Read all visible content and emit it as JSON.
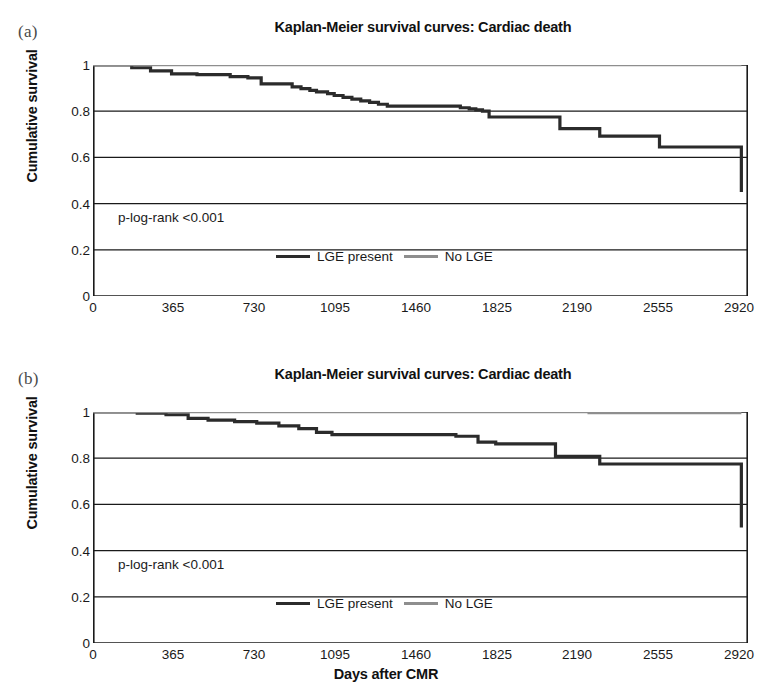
{
  "figure": {
    "xaxis_title": "Days after CMR"
  },
  "panels": [
    {
      "letter": "(a)",
      "title": "Kaplan-Meier survival curves: Cardiac death",
      "ylabel": "Cumulative survival",
      "pvalue": "p-log-rank <0.001",
      "legend": [
        {
          "label": "LGE present",
          "color": "#2b2b2b"
        },
        {
          "label": "No LGE",
          "color": "#8e8e8e"
        }
      ],
      "xticks": [
        "0",
        "365",
        "730",
        "1095",
        "1460",
        "1825",
        "2190",
        "2555",
        "2920"
      ],
      "yticks": [
        "1",
        "0.8",
        "0.6",
        "0.4",
        "0.2",
        "0"
      ]
    },
    {
      "letter": "(b)",
      "title": "Kaplan-Meier survival curves: Cardiac death",
      "ylabel": "Cumulative survival",
      "pvalue": "p-log-rank <0.001",
      "legend": [
        {
          "label": "LGE present",
          "color": "#2b2b2b"
        },
        {
          "label": "No LGE",
          "color": "#8e8e8e"
        }
      ],
      "xticks": [
        "0",
        "365",
        "730",
        "1095",
        "1460",
        "1825",
        "2190",
        "2555",
        "2920"
      ],
      "yticks": [
        "1",
        "0.8",
        "0.6",
        "0.4",
        "0.2",
        "0"
      ]
    }
  ],
  "chart_data": [
    {
      "type": "line",
      "panel": "(a)",
      "title": "Kaplan-Meier survival curves: Cardiac death",
      "xlabel": "Days after CMR",
      "ylabel": "Cumulative survival",
      "xlim": [
        0,
        2960
      ],
      "ylim": [
        0,
        1
      ],
      "xticks": [
        0,
        365,
        730,
        1095,
        1460,
        1825,
        2190,
        2555,
        2920
      ],
      "yticks": [
        0,
        0.2,
        0.4,
        0.6,
        0.8,
        1
      ],
      "grid": "horizontal",
      "legend_position": "bottom-center",
      "annotations": [
        "p-log-rank <0.001"
      ],
      "series": [
        {
          "name": "LGE present",
          "color": "#2b2b2b",
          "step": "post",
          "x": [
            0,
            150,
            175,
            230,
            260,
            330,
            355,
            420,
            470,
            560,
            620,
            660,
            700,
            730,
            760,
            860,
            900,
            940,
            980,
            1010,
            1060,
            1090,
            1130,
            1170,
            1210,
            1250,
            1290,
            1330,
            1600,
            1660,
            1700,
            1730,
            1760,
            1790,
            2080,
            2110,
            2260,
            2290,
            2540,
            2560,
            2930,
            2930
          ],
          "y": [
            1.0,
            1.0,
            0.988,
            0.988,
            0.975,
            0.975,
            0.962,
            0.962,
            0.958,
            0.958,
            0.95,
            0.95,
            0.944,
            0.944,
            0.918,
            0.918,
            0.905,
            0.898,
            0.89,
            0.884,
            0.876,
            0.868,
            0.86,
            0.852,
            0.845,
            0.838,
            0.83,
            0.822,
            0.822,
            0.815,
            0.81,
            0.806,
            0.8,
            0.775,
            0.775,
            0.725,
            0.725,
            0.692,
            0.692,
            0.645,
            0.645,
            0.45
          ]
        },
        {
          "name": "No LGE",
          "color": "#8e8e8e",
          "step": "post",
          "x": [
            0,
            2930
          ],
          "y": [
            1.0,
            1.0
          ]
        }
      ]
    },
    {
      "type": "line",
      "panel": "(b)",
      "title": "Kaplan-Meier survival curves: Cardiac death",
      "xlabel": "Days after CMR",
      "ylabel": "Cumulative survival",
      "xlim": [
        0,
        2960
      ],
      "ylim": [
        0,
        1
      ],
      "xticks": [
        0,
        365,
        730,
        1095,
        1460,
        1825,
        2190,
        2555,
        2920
      ],
      "yticks": [
        0,
        0.2,
        0.4,
        0.6,
        0.8,
        1
      ],
      "grid": "horizontal",
      "legend_position": "bottom-center",
      "annotations": [
        "p-log-rank <0.001"
      ],
      "series": [
        {
          "name": "LGE present",
          "color": "#2b2b2b",
          "step": "post",
          "x": [
            0,
            170,
            200,
            300,
            330,
            400,
            430,
            480,
            520,
            600,
            640,
            700,
            740,
            800,
            840,
            900,
            930,
            980,
            1010,
            1050,
            1080,
            1600,
            1640,
            1700,
            1740,
            1780,
            1820,
            1860,
            2060,
            2090,
            2260,
            2290,
            2930,
            2930
          ],
          "y": [
            1.0,
            1.0,
            0.995,
            0.995,
            0.988,
            0.988,
            0.972,
            0.972,
            0.965,
            0.965,
            0.958,
            0.958,
            0.952,
            0.952,
            0.94,
            0.94,
            0.928,
            0.928,
            0.912,
            0.912,
            0.902,
            0.902,
            0.895,
            0.895,
            0.87,
            0.87,
            0.862,
            0.862,
            0.862,
            0.808,
            0.808,
            0.775,
            0.775,
            0.5
          ]
        },
        {
          "name": "No LGE",
          "color": "#8e8e8e",
          "step": "post",
          "x": [
            0,
            2200,
            2240,
            2930
          ],
          "y": [
            1.0,
            1.0,
            0.995,
            0.995
          ]
        }
      ]
    }
  ]
}
